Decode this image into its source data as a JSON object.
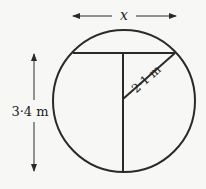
{
  "diagram": {
    "width_label": "x",
    "height_label": "3·4 m",
    "radius_label": "2·1 m",
    "colors": {
      "background": "#f7f7f5",
      "stroke": "#2a2a2a"
    }
  }
}
